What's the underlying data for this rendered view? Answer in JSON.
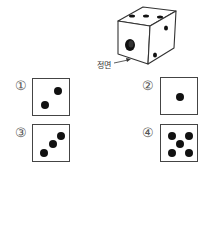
{
  "cube": {
    "front_label": "정면",
    "top_face_pips": 3,
    "front_face_pips": 1,
    "right_face_pips": 2
  },
  "options": [
    {
      "marker": "①",
      "pips": 2
    },
    {
      "marker": "②",
      "pips": 1
    },
    {
      "marker": "③",
      "pips": 3
    },
    {
      "marker": "④",
      "pips": 5
    }
  ]
}
